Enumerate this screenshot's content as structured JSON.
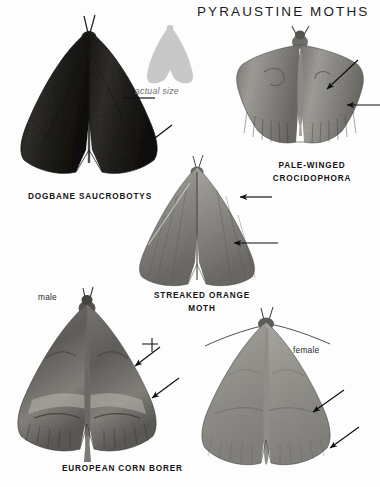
{
  "page": {
    "title": "PYRAUSTINE MOTHS",
    "background_color": "#ffffff",
    "text_color": "#141414"
  },
  "scale_reference": {
    "label": "actual size",
    "silhouette_color": "#c8c8c8",
    "icon": "moth-silhouette-icon"
  },
  "specimens": [
    {
      "id": "dogbane-saucrobotys",
      "caption": "DOGBANE SAUCROBOTYS",
      "caption_lines": [
        "DOGBANE SAUCROBOTYS"
      ],
      "tone": "#2a2724",
      "sex_label": "",
      "pointer_count": 2
    },
    {
      "id": "pale-winged-crocidophora",
      "caption": "PALE-WINGED CROCIDOPHORA",
      "caption_lines": [
        "PALE-WINGED",
        "CROCIDOPHORA"
      ],
      "tone": "#8e8d88",
      "sex_label": "",
      "pointer_count": 2
    },
    {
      "id": "streaked-orange-moth",
      "caption": "STREAKED ORANGE MOTH",
      "caption_lines": [
        "STREAKED ORANGE",
        "MOTH"
      ],
      "tone": "#8a8782",
      "sex_label": "",
      "pointer_count": 2
    },
    {
      "id": "european-corn-borer-male",
      "caption": "EUROPEAN CORN BORER",
      "caption_lines": [
        "EUROPEAN CORN BORER"
      ],
      "tone": "#6f6d68",
      "sex_label": "male",
      "pointer_count": 2
    },
    {
      "id": "european-corn-borer-female",
      "caption": "",
      "caption_lines": [],
      "tone": "#9b9a94",
      "sex_label": "female",
      "pointer_count": 2
    }
  ],
  "labels": {
    "dogbane": "DOGBANE SAUCROBOTYS",
    "pale_winged_1": "PALE-WINGED",
    "pale_winged_2": "CROCIDOPHORA",
    "streaked_1": "STREAKED ORANGE",
    "streaked_2": "MOTH",
    "corn_borer": "EUROPEAN CORN BORER",
    "male": "male",
    "female": "female",
    "actual_size": "actual size"
  }
}
